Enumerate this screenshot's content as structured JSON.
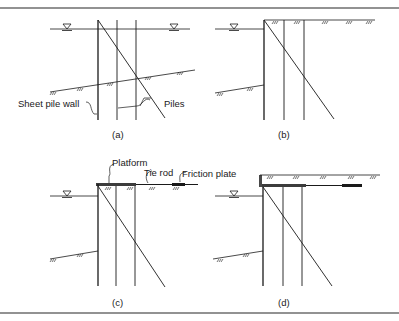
{
  "figure": {
    "border_color": "#6e6e6e",
    "line_color": "#1a1a1a",
    "panels": [
      {
        "id": "a",
        "caption": "(a)",
        "labels": {
          "sheet_pile_wall": "Sheet pile wall",
          "piles": "Piles"
        }
      },
      {
        "id": "b",
        "caption": "(b)"
      },
      {
        "id": "c",
        "caption": "(c)",
        "labels": {
          "platform": "Platform",
          "tie_rod": "Tie rod",
          "friction_plate": "Friction plate"
        }
      },
      {
        "id": "d",
        "caption": "(d)"
      }
    ]
  }
}
